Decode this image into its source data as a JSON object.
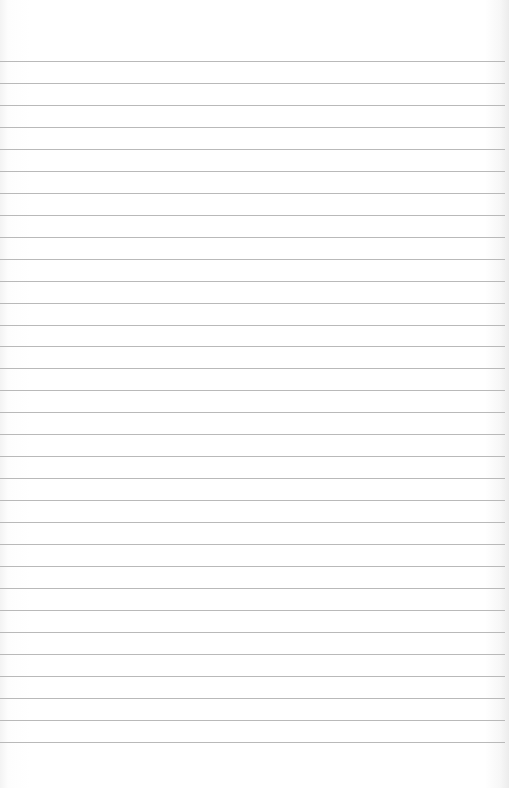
{
  "paper": {
    "type": "ruled-sheet",
    "line_count": 32,
    "first_line_y": 61,
    "line_spacing": 21.96,
    "line_color": "#b9b9b9",
    "background": "#ffffff"
  }
}
